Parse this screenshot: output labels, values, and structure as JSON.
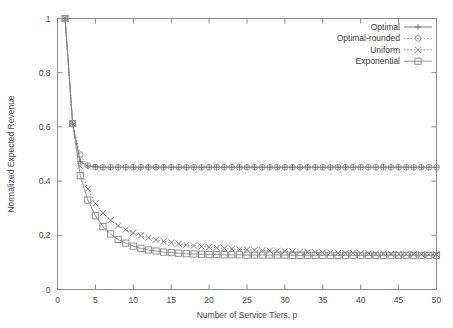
{
  "chart_data": {
    "type": "line",
    "title": "",
    "xlabel": "Number of Service Tiers, p",
    "ylabel": "Normalized Expected Revenue",
    "xlim": [
      0,
      50
    ],
    "ylim": [
      0,
      1
    ],
    "xticks": [
      0,
      5,
      10,
      15,
      20,
      25,
      30,
      35,
      40,
      45,
      50
    ],
    "xticklabels": [
      "0",
      "5",
      "10",
      "15",
      "20",
      "25",
      "30",
      "35",
      "40",
      "45",
      "50"
    ],
    "yticks": [
      0,
      0.2,
      0.4,
      0.6,
      0.8,
      1
    ],
    "yticklabels": [
      "0",
      "0.2",
      "0.4",
      "0.6",
      "0.8",
      "1"
    ],
    "grid": false,
    "legend_position": "top-right",
    "x": [
      1,
      2,
      3,
      4,
      5,
      6,
      7,
      8,
      9,
      10,
      11,
      12,
      13,
      14,
      15,
      16,
      17,
      18,
      19,
      20,
      21,
      22,
      23,
      24,
      25,
      26,
      27,
      28,
      29,
      30,
      31,
      32,
      33,
      34,
      35,
      36,
      37,
      38,
      39,
      40,
      41,
      42,
      43,
      44,
      45,
      46,
      47,
      48,
      49,
      50
    ],
    "series": [
      {
        "name": "Optimal",
        "marker": "plus",
        "linestyle": "solid",
        "color": "#6e6e6e",
        "values": [
          1.0,
          0.612,
          0.472,
          0.455,
          0.452,
          0.451,
          0.451,
          0.451,
          0.451,
          0.451,
          0.451,
          0.451,
          0.451,
          0.451,
          0.451,
          0.451,
          0.451,
          0.451,
          0.451,
          0.451,
          0.451,
          0.451,
          0.451,
          0.451,
          0.451,
          0.451,
          0.451,
          0.451,
          0.451,
          0.451,
          0.451,
          0.451,
          0.451,
          0.451,
          0.451,
          0.451,
          0.451,
          0.451,
          0.451,
          0.451,
          0.451,
          0.451,
          0.451,
          0.451,
          0.451,
          0.451,
          0.451,
          0.451,
          0.451,
          0.451
        ]
      },
      {
        "name": "Optimal-rounded",
        "marker": "circle",
        "linestyle": "dotted",
        "color": "#8f8f8f",
        "values": [
          1.0,
          0.612,
          0.498,
          0.458,
          0.452,
          0.451,
          0.451,
          0.451,
          0.451,
          0.451,
          0.451,
          0.451,
          0.451,
          0.451,
          0.451,
          0.451,
          0.451,
          0.451,
          0.451,
          0.451,
          0.451,
          0.451,
          0.451,
          0.451,
          0.451,
          0.451,
          0.451,
          0.451,
          0.451,
          0.451,
          0.451,
          0.451,
          0.451,
          0.451,
          0.451,
          0.451,
          0.451,
          0.451,
          0.451,
          0.451,
          0.451,
          0.451,
          0.451,
          0.451,
          0.451,
          0.451,
          0.451,
          0.451,
          0.451,
          0.451
        ]
      },
      {
        "name": "Uniform",
        "marker": "cross",
        "linestyle": "dotted",
        "color": "#7d7d7d",
        "values": [
          1.0,
          0.612,
          0.455,
          0.371,
          0.318,
          0.282,
          0.256,
          0.236,
          0.221,
          0.209,
          0.199,
          0.191,
          0.184,
          0.178,
          0.173,
          0.169,
          0.165,
          0.162,
          0.159,
          0.156,
          0.154,
          0.152,
          0.15,
          0.148,
          0.147,
          0.145,
          0.144,
          0.143,
          0.142,
          0.141,
          0.14,
          0.139,
          0.138,
          0.137,
          0.136,
          0.136,
          0.135,
          0.134,
          0.134,
          0.133,
          0.133,
          0.132,
          0.132,
          0.131,
          0.131,
          0.13,
          0.13,
          0.13,
          0.129,
          0.129
        ]
      },
      {
        "name": "Exponential",
        "marker": "square",
        "linestyle": "solid",
        "color": "#888888",
        "values": [
          1.0,
          0.612,
          0.42,
          0.33,
          0.272,
          0.232,
          0.205,
          0.185,
          0.171,
          0.16,
          0.152,
          0.146,
          0.142,
          0.138,
          0.136,
          0.134,
          0.132,
          0.131,
          0.13,
          0.129,
          0.129,
          0.128,
          0.128,
          0.128,
          0.127,
          0.127,
          0.127,
          0.127,
          0.127,
          0.127,
          0.126,
          0.126,
          0.126,
          0.126,
          0.126,
          0.126,
          0.126,
          0.126,
          0.126,
          0.126,
          0.126,
          0.126,
          0.126,
          0.126,
          0.126,
          0.126,
          0.126,
          0.126,
          0.126,
          0.126
        ]
      }
    ]
  }
}
